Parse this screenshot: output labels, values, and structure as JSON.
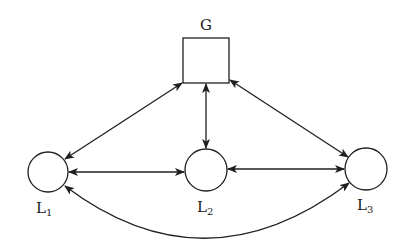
{
  "diagram": {
    "type": "network-graph",
    "stroke_color": "#1f1f1f",
    "background": "#ffffff",
    "nodes": [
      {
        "id": "G",
        "label": "G",
        "subscript": "",
        "shape": "square",
        "cx": 206,
        "cy": 60,
        "size": 46,
        "label_x": 206,
        "label_y": 30
      },
      {
        "id": "L1",
        "label": "L",
        "subscript": "1",
        "shape": "circle",
        "cx": 48,
        "cy": 172,
        "r": 20,
        "label_x": 40,
        "label_y": 212
      },
      {
        "id": "L2",
        "label": "L",
        "subscript": "2",
        "shape": "circle",
        "cx": 206,
        "cy": 170,
        "r": 21,
        "label_x": 201,
        "label_y": 211
      },
      {
        "id": "L3",
        "label": "L",
        "subscript": "3",
        "shape": "circle",
        "cx": 366,
        "cy": 169,
        "r": 21,
        "label_x": 361,
        "label_y": 209
      }
    ],
    "edges": [
      {
        "from": "G",
        "to": "L1",
        "bidirectional": true,
        "style": "straight"
      },
      {
        "from": "G",
        "to": "L2",
        "bidirectional": true,
        "style": "straight"
      },
      {
        "from": "G",
        "to": "L3",
        "bidirectional": true,
        "style": "straight"
      },
      {
        "from": "L1",
        "to": "L2",
        "bidirectional": true,
        "style": "straight"
      },
      {
        "from": "L2",
        "to": "L3",
        "bidirectional": true,
        "style": "straight"
      },
      {
        "from": "L1",
        "to": "L3",
        "bidirectional": true,
        "style": "curved-below"
      }
    ]
  }
}
